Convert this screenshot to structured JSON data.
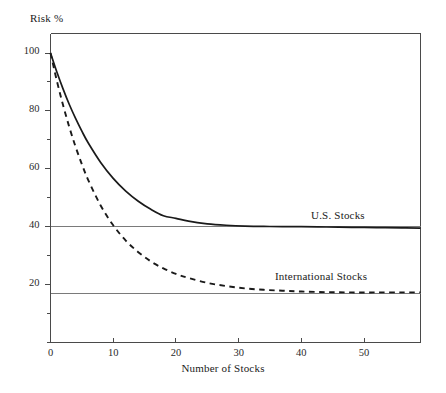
{
  "chart_data": {
    "type": "line",
    "title": "",
    "xlabel": "Number of Stocks",
    "ylabel": "Risk %",
    "xlim": [
      0,
      59
    ],
    "ylim": [
      0,
      108
    ],
    "grid": false,
    "legend_position": "inline-annotation",
    "xticks": [
      0,
      10,
      20,
      30,
      40,
      50
    ],
    "xtick_labels": [
      "0",
      "10",
      "20",
      "30",
      "40",
      "50"
    ],
    "yticks": [
      20,
      40,
      60,
      80,
      100
    ],
    "ytick_labels": [
      "20",
      "40",
      "60",
      "80",
      "100"
    ],
    "yticks_minor": [
      10,
      30,
      50,
      70,
      90
    ],
    "reference_lines": [
      {
        "name": "us-asymptote",
        "y": 40
      },
      {
        "name": "international-asymptote",
        "y": 17
      }
    ],
    "series": [
      {
        "name": "U.S. Stocks",
        "style": "solid",
        "color": "#1a1a1a",
        "asymptote": 40,
        "x": [
          0,
          1,
          2,
          3,
          4,
          5,
          6,
          8,
          10,
          12,
          14,
          16,
          18,
          20,
          22,
          25,
          28,
          31,
          34,
          37,
          40,
          44,
          48,
          52,
          56,
          59
        ],
        "y": [
          100,
          93.5,
          87.6,
          82.2,
          77.4,
          73.0,
          69.0,
          62.2,
          56.7,
          52.3,
          48.8,
          46.0,
          43.8,
          42.9,
          41.9,
          41.0,
          40.5,
          40.2,
          40.1,
          40.0,
          40.0,
          39.9,
          39.8,
          39.7,
          39.6,
          39.5
        ]
      },
      {
        "name": "International Stocks",
        "style": "dashed",
        "color": "#1a1a1a",
        "asymptote": 17,
        "x": [
          0,
          1,
          2,
          3,
          4,
          5,
          6,
          8,
          10,
          12,
          14,
          16,
          18,
          20,
          22,
          25,
          28,
          31,
          34,
          37,
          40,
          44,
          48,
          52,
          56,
          59
        ],
        "y": [
          100,
          90.5,
          82.0,
          74.4,
          67.6,
          61.6,
          56.2,
          47.3,
          40.5,
          35.2,
          31.2,
          28.0,
          25.6,
          23.7,
          22.3,
          20.6,
          19.5,
          18.7,
          18.2,
          17.9,
          17.6,
          17.4,
          17.3,
          17.3,
          17.3,
          17.3
        ]
      }
    ],
    "annotations": [
      {
        "name": "U.S. Stocks",
        "x": 42,
        "y": 44
      },
      {
        "name": "International Stocks",
        "x": 36,
        "y": 24
      }
    ]
  },
  "axes": {
    "y_title": "Risk %",
    "x_title": "Number of Stocks"
  },
  "labels": {
    "us_stocks": "U.S. Stocks",
    "international_stocks": "International Stocks"
  },
  "ticks": {
    "x": [
      "0",
      "10",
      "20",
      "30",
      "40",
      "50"
    ],
    "y": [
      "20",
      "40",
      "60",
      "80",
      "100"
    ]
  },
  "colors": {
    "line": "#1a1a1a",
    "axis": "#4a4a4a",
    "reference": "#7a7a7a",
    "background": "#ffffff"
  }
}
